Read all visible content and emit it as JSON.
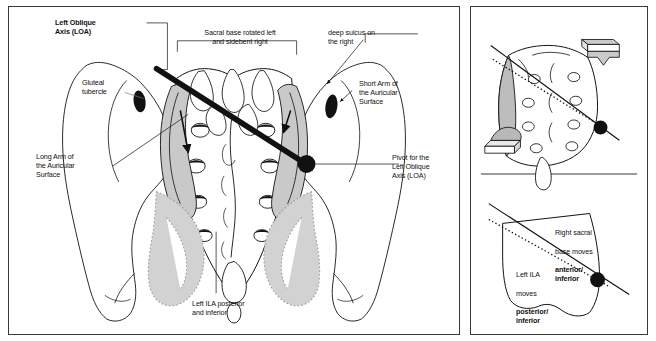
{
  "figure": {
    "title_label": "Left Oblique Axis (LOA)",
    "background_color": "#ffffff",
    "line_color": "#111111",
    "shade_color": "#c9c9c9",
    "panels": [
      {
        "name": "main-pelvis-panel"
      },
      {
        "name": "side-sacrum-panel"
      }
    ]
  },
  "main_panel": {
    "labels": {
      "left_oblique_axis": "Left Oblique\nAxis (LOA)",
      "sacral_base": "Sacral base rotated left\nand sidebent right",
      "deep_sulcus": "deep sulcus on\nthe right",
      "gluteal_tubercle": "Gluteal\ntubercle",
      "short_arm": "Short  Arm of\nthe Auricular\nSurface",
      "long_arm": "Long Arm of\nthe Auricular\nSurface",
      "pivot": "Pivot for the\nLeft Oblique\nAxis (LOA)",
      "left_ila": "Left ILA posterior\nand inferior"
    }
  },
  "side_panel": {
    "top": {
      "name": "sacrum-oblique-view"
    },
    "bottom": {
      "right_sacral_base_line1": "Right sacral",
      "right_sacral_base_line2": "base moves",
      "right_sacral_base_emph": "anterior/\ninferior",
      "left_ila_line1": "Left ILA",
      "left_ila_line2": "moves",
      "left_ila_emph": "posterior/\ninferior"
    }
  }
}
